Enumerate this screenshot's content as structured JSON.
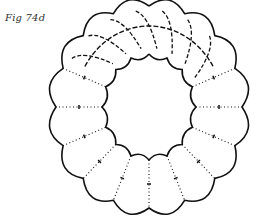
{
  "figure": {
    "caption": "Fig 74d"
  },
  "drawing": {
    "center": [
      149,
      107
    ],
    "outer": {
      "rx": 93,
      "ry": 101,
      "lobes": 16,
      "bulge": 9
    },
    "inner": {
      "rx": 47,
      "ry": 53,
      "lobes": 16,
      "bulge": 4
    },
    "stroke_color": "#111111",
    "stroke_width": 1.6,
    "dashed_arc_range_deg": [
      -150,
      -30
    ],
    "seam_count": 16,
    "seam_tick_length": 4
  }
}
